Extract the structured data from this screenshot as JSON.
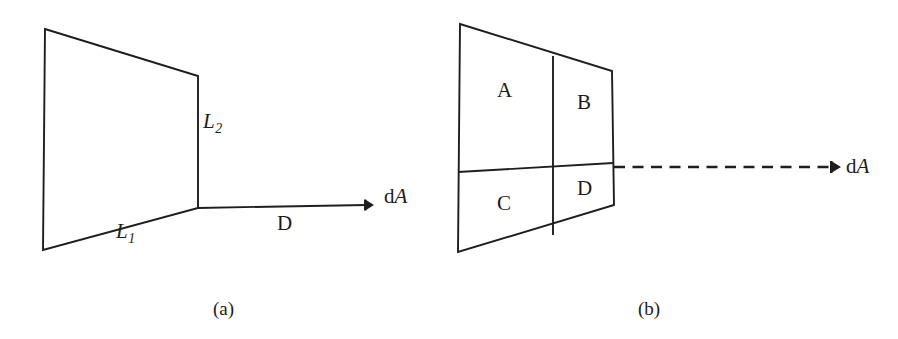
{
  "figure": {
    "background_color": "#ffffff",
    "ink_color": "#201d1c"
  },
  "panels": [
    {
      "id": "a",
      "caption": "(a)",
      "description": "Single rectangular surface with length labels and a solid leader line to an area element",
      "labels": {
        "L2": {
          "base": "L",
          "subscript": "2"
        },
        "L1": {
          "base": "L",
          "subscript": "1"
        },
        "distance": "D",
        "area_element": {
          "prefix": "d",
          "symbol": "A"
        }
      },
      "geometry": {
        "surface_corners": [
          [
            45,
            29
          ],
          [
            198,
            76
          ],
          [
            198,
            208
          ],
          [
            43,
            250
          ]
        ],
        "leader_line": {
          "from": [
            198,
            208
          ],
          "to": [
            371,
            205
          ],
          "style": "solid",
          "arrow": "end"
        }
      }
    },
    {
      "id": "b",
      "caption": "(b)",
      "description": "Rectangular surface subdivided into four quadrants A, B, C, D with a dashed leader line to an area element",
      "labels": {
        "quadrants": [
          "A",
          "B",
          "C",
          "D"
        ],
        "area_element": {
          "prefix": "d",
          "symbol": "A"
        }
      },
      "geometry": {
        "surface_corners": [
          [
            460,
            24
          ],
          [
            612,
            71
          ],
          [
            614,
            205
          ],
          [
            458,
            252
          ]
        ],
        "vertical_divider": [
          [
            553,
            56
          ],
          [
            553,
            235
          ]
        ],
        "horizontal_divider": [
          [
            458,
            172
          ],
          [
            613,
            163
          ]
        ],
        "leader_line": {
          "from": [
            614,
            167
          ],
          "to": [
            840,
            167
          ],
          "style": "dashed",
          "arrow": "end"
        }
      }
    }
  ]
}
